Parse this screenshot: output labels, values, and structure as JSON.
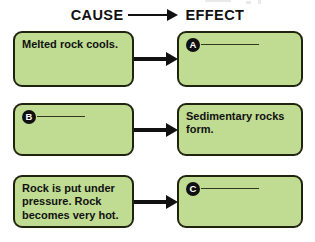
{
  "header": {
    "cause_label": "CAUSE",
    "effect_label": "EFFECT",
    "arrow_icon": "right-arrow-icon"
  },
  "colors": {
    "box_fill": "#bfdc92",
    "box_border": "#20240f",
    "arrow": "#111111",
    "marker_fill": "#101010",
    "marker_text": "#ffffff",
    "text": "#111111",
    "background": "#ffffff"
  },
  "rows": [
    {
      "cause": {
        "type": "text",
        "text": "Melted rock cools."
      },
      "arrow_icon": "right-arrow-icon",
      "effect": {
        "type": "blank",
        "marker": "A",
        "text": ""
      }
    },
    {
      "cause": {
        "type": "blank",
        "marker": "B",
        "text": ""
      },
      "arrow_icon": "right-arrow-icon",
      "effect": {
        "type": "text",
        "text": "Sedimentary rocks\nform."
      }
    },
    {
      "cause": {
        "type": "text",
        "text": "Rock is put under\npressure. Rock\nbecomes very hot."
      },
      "arrow_icon": "right-arrow-icon",
      "effect": {
        "type": "blank",
        "marker": "C",
        "text": ""
      }
    }
  ]
}
